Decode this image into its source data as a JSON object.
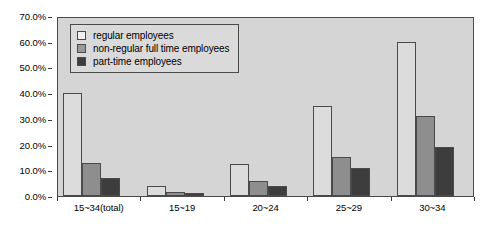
{
  "chart_data": {
    "type": "bar",
    "title": "",
    "subtitle": "",
    "xlabel": "",
    "ylabel": "",
    "grid": false,
    "legend_position": "top-left-inside",
    "categories": [
      "15~34(total)",
      "15~19",
      "20~24",
      "25~29",
      "30~34"
    ],
    "series": [
      {
        "name": "regular employees",
        "color": "#dcdcdc",
        "values": [
          40.0,
          4.0,
          12.5,
          35.0,
          60.0
        ]
      },
      {
        "name": "non-regular full time employees",
        "color": "#8e8e8e",
        "values": [
          13.0,
          1.5,
          6.0,
          15.0,
          31.0
        ]
      },
      {
        "name": "part-time employees",
        "color": "#3d3d3d",
        "values": [
          7.0,
          1.0,
          4.0,
          11.0,
          19.0
        ]
      }
    ],
    "ylim": [
      0,
      70
    ],
    "y_tick_labels": [
      "0.0%",
      "10.0%",
      "20.0%",
      "30.0%",
      "40.0%",
      "50.0%",
      "60.0%",
      "70.0%"
    ],
    "y_tick_values": [
      0,
      10,
      20,
      30,
      40,
      50,
      60,
      70
    ],
    "x_tick_labels": [
      "15~34(total)",
      "15~19",
      "20~24",
      "25~29",
      "30~34"
    ]
  },
  "colors": {
    "plot_background": "#d5d5d5",
    "axis_line": "#4a4a4a",
    "legend_background": "#dadada",
    "page_background": "#ffffff"
  }
}
